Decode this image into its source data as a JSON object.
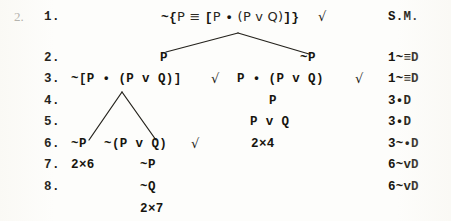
{
  "problem": {
    "outer_number": "2."
  },
  "tree": {
    "lines": [
      {
        "number": "1.",
        "formula": "~{P ≡ [P • (P v Q)]}",
        "check": "√",
        "justification": "S.M."
      },
      {
        "number": "2.",
        "left_branch": "P",
        "right_branch": "~P",
        "justification": "1~≡D"
      },
      {
        "number": "3.",
        "left_branch": "~[P • (P v Q)]",
        "left_check": "√",
        "right_branch": "P • (P v Q)",
        "right_check": "√",
        "justification": "1~≡D"
      },
      {
        "number": "4.",
        "right_branch": "P",
        "justification": "3•D"
      },
      {
        "number": "5.",
        "right_branch": "P v Q",
        "justification": "3•D"
      },
      {
        "number": "6.",
        "left_branch_a": "~P",
        "left_branch_b": "~(P v Q)",
        "left_check": "√",
        "closure_right": "2×4",
        "justification": "3~•D"
      },
      {
        "number": "7.",
        "closure_left": "2×6",
        "mid": "~P",
        "justification": "6~vD"
      },
      {
        "number": "8.",
        "mid": "~Q",
        "justification": "6~vD"
      }
    ],
    "final_closure": "2×7"
  },
  "labels": {
    "root_prefix": "~{",
    "root_p1": "P",
    "root_equiv": "≡",
    "root_lbrack": "[",
    "root_p2": "P",
    "root_dot": "•",
    "root_lparen": "(",
    "root_p3": "P",
    "root_vee": "v",
    "root_q": "Q",
    "root_rparen": ")",
    "root_rbrack": "]",
    "root_rbrace": "}"
  }
}
